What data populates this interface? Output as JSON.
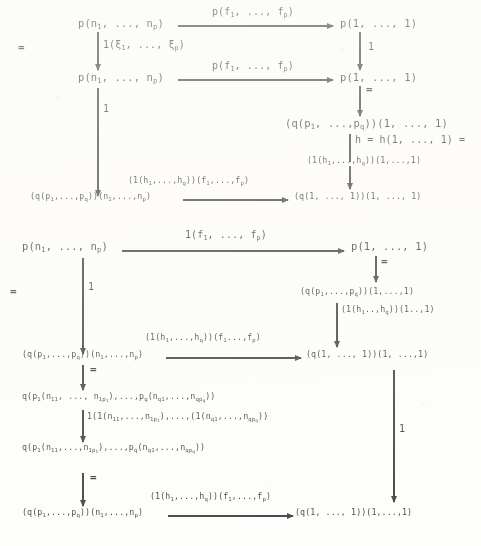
{
  "document": {
    "type": "commutative-diagram",
    "description": "Scanned mathematical commutative diagram with operad-style composition arrows"
  },
  "equals_marks": [
    {
      "id": "eq-left-1",
      "text": "="
    },
    {
      "id": "eq-left-2",
      "text": "="
    },
    {
      "id": "eq-right-1",
      "text": "="
    },
    {
      "id": "eq-right-2",
      "text": "="
    },
    {
      "id": "eq-mid-1",
      "text": "="
    },
    {
      "id": "eq-mid-2",
      "text": "="
    }
  ],
  "diagram_upper": {
    "nodes": {
      "top_left": {
        "text": "p(n1, ..., np)"
      },
      "top_right": {
        "text": "p(1, ..., 1)"
      },
      "mid_left": {
        "text": "p(n1, ..., np)"
      },
      "mid_right": {
        "text": "p(1, ..., 1)"
      },
      "right_3": {
        "text": "(q(p1, ...,pq))(1, ..., 1)"
      },
      "bottom_left": {
        "text": "(q(p1,...,pq))(n1,...,np)"
      },
      "bottom_right": {
        "text": "(q(1, ..., 1))(1, ..., 1)"
      }
    },
    "arrows": {
      "top_horizontal": {
        "label": "p(f1, ..., fp)"
      },
      "mid_horizontal": {
        "label": "p(f1, ..., fp)"
      },
      "bottom_horizontal": {
        "label": "(1(h1,...,hq))(f1,...,fp)"
      },
      "left_vertical_1": {
        "label": "1(ξ1, ..., ξp)"
      },
      "left_vertical_2": {
        "label": "1"
      },
      "right_vertical_1": {
        "label": "1"
      },
      "right_vertical_2": {
        "label": ""
      },
      "right_vertical_3": {
        "label": "h = h(1, ..., 1) ="
      },
      "right_vertical_3b": {
        "label": "(1(h1,...,hq))(1,...,1)"
      }
    }
  },
  "diagram_lower": {
    "nodes": {
      "top_left": {
        "text": "p(n1, ..., np)"
      },
      "top_right": {
        "text": "p(1, ..., 1)"
      },
      "right_2": {
        "text": "(q(p1,...,pq))(1,...,1)"
      },
      "mid_left": {
        "text": "(q(p1,...,pq))(n1,...,np)"
      },
      "mid_right": {
        "text": "(q(1, ..., 1))(1, ...,1)"
      },
      "expand_1": {
        "text": "q(p1(n11, ..., n1p1),...,pq(nq1,...,nqpq))"
      },
      "expand_2": {
        "text": "q(p1(n11,...,n1p1),...,pq(nq1,...,nqpq))"
      },
      "bottom_left": {
        "text": "(q(p1,...,pq))(n1,...,np)"
      },
      "bottom_right": {
        "text": "(q(1, ..., 1))(1,...,1)"
      }
    },
    "arrows": {
      "top_horizontal": {
        "label": "1(f1, ..., fp)"
      },
      "mid_horizontal": {
        "label": "(1(h1,...,hq))(f1...,fp)"
      },
      "bottom_horizontal": {
        "label": "(1(h1,...,hq))(f1,...,fp)"
      },
      "left_vertical_1": {
        "label": "1"
      },
      "right_vertical_1": {
        "label": ""
      },
      "right_vertical_2": {
        "label": "(1(h1..,hq))(1..,1)"
      },
      "right_vertical_3": {
        "label": "1"
      },
      "expand_vertical": {
        "label": "1(1(n11,...,n1p1),...,(1(nq1,...,nqpq))"
      }
    }
  }
}
